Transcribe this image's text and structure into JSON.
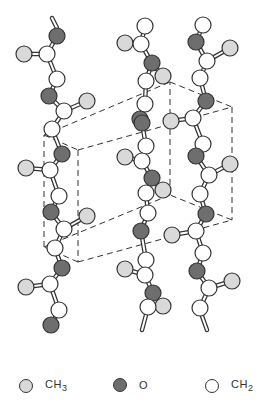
{
  "diagram": {
    "colors": {
      "CH3_fill": "#d9d9d9",
      "O_fill": "#6e6e6e",
      "CH2_fill": "#ffffff",
      "stroke": "#333333",
      "cell_stroke": "#333333"
    },
    "atom_radius": 8,
    "chains": [
      {
        "id": "left",
        "atoms": [
          {
            "t": "O",
            "x": 57,
            "y": 36
          },
          {
            "t": "CH2",
            "x": 47,
            "y": 54
          },
          {
            "t": "CH3",
            "x": 24,
            "y": 54
          },
          {
            "t": "CH2",
            "x": 57,
            "y": 79
          },
          {
            "t": "O",
            "x": 49,
            "y": 96
          },
          {
            "t": "CH2",
            "x": 64,
            "y": 111
          },
          {
            "t": "CH3",
            "x": 87,
            "y": 101
          },
          {
            "t": "CH2",
            "x": 52,
            "y": 129
          },
          {
            "t": "O",
            "x": 62,
            "y": 154
          },
          {
            "t": "CH2",
            "x": 50,
            "y": 170
          },
          {
            "t": "CH3",
            "x": 26,
            "y": 168
          },
          {
            "t": "CH2",
            "x": 59,
            "y": 196
          },
          {
            "t": "O",
            "x": 51,
            "y": 212
          },
          {
            "t": "CH2",
            "x": 64,
            "y": 229
          },
          {
            "t": "CH3",
            "x": 87,
            "y": 216
          },
          {
            "t": "CH2",
            "x": 55,
            "y": 248
          },
          {
            "t": "O",
            "x": 62,
            "y": 268
          },
          {
            "t": "CH2",
            "x": 50,
            "y": 284
          },
          {
            "t": "CH3",
            "x": 26,
            "y": 287
          },
          {
            "t": "CH2",
            "x": 59,
            "y": 310
          },
          {
            "t": "O",
            "x": 51,
            "y": 325
          }
        ],
        "top_stub": [
          52,
          18,
          57,
          28
        ]
      },
      {
        "id": "middle",
        "atoms": [
          {
            "t": "CH2",
            "x": 145,
            "y": 26
          },
          {
            "t": "CH3",
            "x": 125,
            "y": 43
          },
          {
            "t": "CH2",
            "x": 141,
            "y": 44
          },
          {
            "t": "O",
            "x": 152,
            "y": 63
          },
          {
            "t": "CH2",
            "x": 146,
            "y": 81
          },
          {
            "t": "CH3",
            "x": 163,
            "y": 76
          },
          {
            "t": "CH2",
            "x": 145,
            "y": 104
          },
          {
            "t": "O",
            "x": 140,
            "y": 119
          },
          {
            "t": "CH3",
            "x": 125,
            "y": 157
          },
          {
            "t": "O",
            "x": 142,
            "y": 123
          },
          {
            "t": "CH2",
            "x": 146,
            "y": 146
          },
          {
            "t": "CH2",
            "x": 142,
            "y": 161
          },
          {
            "t": "O",
            "x": 152,
            "y": 178
          },
          {
            "t": "CH3",
            "x": 163,
            "y": 190
          },
          {
            "t": "CH2",
            "x": 146,
            "y": 193
          },
          {
            "t": "CH2",
            "x": 148,
            "y": 213
          },
          {
            "t": "O",
            "x": 141,
            "y": 231
          },
          {
            "t": "CH3",
            "x": 125,
            "y": 269
          },
          {
            "t": "CH2",
            "x": 146,
            "y": 260
          },
          {
            "t": "CH2",
            "x": 145,
            "y": 275
          },
          {
            "t": "O",
            "x": 153,
            "y": 293
          },
          {
            "t": "CH3",
            "x": 163,
            "y": 306
          },
          {
            "t": "CH2",
            "x": 148,
            "y": 307
          }
        ],
        "bottom_stub": [
          146,
          315,
          142,
          330
        ]
      },
      {
        "id": "right",
        "atoms": [
          {
            "t": "CH2",
            "x": 203,
            "y": 25
          },
          {
            "t": "O",
            "x": 196,
            "y": 42
          },
          {
            "t": "CH2",
            "x": 207,
            "y": 61
          },
          {
            "t": "CH3",
            "x": 230,
            "y": 48
          },
          {
            "t": "CH2",
            "x": 200,
            "y": 78
          },
          {
            "t": "O",
            "x": 206,
            "y": 101
          },
          {
            "t": "CH2",
            "x": 193,
            "y": 118
          },
          {
            "t": "CH3",
            "x": 171,
            "y": 121
          },
          {
            "t": "CH2",
            "x": 203,
            "y": 144
          },
          {
            "t": "O",
            "x": 196,
            "y": 156
          },
          {
            "t": "CH2",
            "x": 209,
            "y": 175
          },
          {
            "t": "CH3",
            "x": 230,
            "y": 164
          },
          {
            "t": "CH2",
            "x": 200,
            "y": 194
          },
          {
            "t": "O",
            "x": 206,
            "y": 214
          },
          {
            "t": "CH2",
            "x": 196,
            "y": 231
          },
          {
            "t": "CH3",
            "x": 172,
            "y": 235
          },
          {
            "t": "CH2",
            "x": 203,
            "y": 253
          },
          {
            "t": "O",
            "x": 197,
            "y": 271
          },
          {
            "t": "CH2",
            "x": 209,
            "y": 288
          },
          {
            "t": "CH3",
            "x": 232,
            "y": 281
          },
          {
            "t": "CH2",
            "x": 200,
            "y": 308
          }
        ],
        "bottom_stub": [
          202,
          316,
          207,
          330
        ]
      }
    ],
    "unit_cell": {
      "front": [
        [
          44,
          135
        ],
        [
          78,
          150
        ],
        [
          78,
          262
        ],
        [
          44,
          247
        ]
      ],
      "back": [
        [
          170,
          82
        ],
        [
          232,
          107
        ],
        [
          232,
          220
        ],
        [
          170,
          195
        ]
      ],
      "connect": [
        [
          44,
          135,
          170,
          82
        ],
        [
          78,
          150,
          232,
          107
        ],
        [
          78,
          262,
          232,
          220
        ],
        [
          44,
          247,
          170,
          195
        ]
      ]
    }
  },
  "legend": {
    "items": [
      {
        "label_main": "CH",
        "label_sub": "3",
        "fill": "#d9d9d9",
        "name": "methyl"
      },
      {
        "label_main": "O",
        "label_sub": "",
        "fill": "#6e6e6e",
        "name": "oxygen"
      },
      {
        "label_main": "CH",
        "label_sub": "2",
        "fill": "#ffffff",
        "name": "methylene"
      }
    ]
  }
}
